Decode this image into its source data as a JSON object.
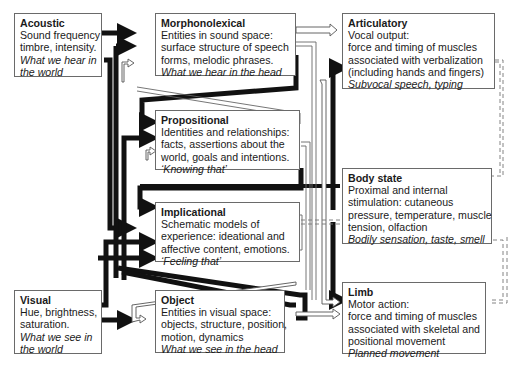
{
  "diagram": {
    "type": "interacting-cognitive-subsystems",
    "boxes": {
      "acoustic": {
        "title": "Acoustic",
        "lines": [
          "Sound frequency",
          "timbre, intensity."
        ],
        "italic": [
          "What we hear in",
          "the world"
        ]
      },
      "morphonolexical": {
        "title": "Morphonolexical",
        "lines": [
          "Entities in sound space:",
          "surface structure of speech",
          "forms, melodic phrases."
        ],
        "italic": [
          "What we hear in the head"
        ]
      },
      "articulatory": {
        "title": "Articulatory",
        "lines": [
          "Vocal output:",
          "force and timing of muscles",
          "associated with verbalization",
          "(including hands and fingers)"
        ],
        "italic": [
          "Subvocal speech, typing"
        ]
      },
      "propositional": {
        "title": "Propositional",
        "lines": [
          "Identities and relationships:",
          "facts, assertions about the",
          "world, goals and intentions."
        ],
        "italic": [
          "‘Knowing that’"
        ]
      },
      "body_state": {
        "title": "Body state",
        "lines": [
          "Proximal and internal",
          "stimulation: cutaneous",
          "pressure, temperature, muscle",
          "tension, olfaction"
        ],
        "italic": [
          "Bodily sensation, taste, smell"
        ]
      },
      "implicational": {
        "title": "Implicational",
        "lines": [
          "Schematic models of",
          "experience: ideational and",
          "affective content, emotions."
        ],
        "italic": [
          "‘Feeling that’"
        ]
      },
      "visual": {
        "title": "Visual",
        "lines": [
          "Hue, brightness,",
          "saturation."
        ],
        "italic": [
          "What we see in",
          "the world"
        ]
      },
      "object": {
        "title": "Object",
        "lines": [
          "Entities in visual space:",
          "objects, structure, position,",
          "motion, dynamics"
        ],
        "italic": [
          "What we see in the head"
        ]
      },
      "limb": {
        "title": "Limb",
        "lines": [
          "Motor action:",
          "force and timing of muscles",
          "associated with skeletal and",
          "positional movement"
        ],
        "italic": [
          "Planned movement"
        ]
      }
    },
    "edges": [
      {
        "from": "Acoustic",
        "to": "Morphonolexical",
        "style": "thick"
      },
      {
        "from": "Acoustic",
        "to": "Implicational",
        "style": "thick"
      },
      {
        "from": "Visual",
        "to": "Object",
        "style": "thick"
      },
      {
        "from": "Visual",
        "to": "Implicational",
        "style": "thick"
      },
      {
        "from": "Morphonolexical",
        "to": "Propositional",
        "style": "thick"
      },
      {
        "from": "Morphonolexical",
        "to": "Articulatory",
        "style": "open"
      },
      {
        "from": "Morphonolexical",
        "to": "Limb",
        "style": "open"
      },
      {
        "from": "Propositional",
        "to": "Morphonolexical",
        "style": "thick"
      },
      {
        "from": "Propositional",
        "to": "Implicational",
        "style": "thick"
      },
      {
        "from": "Propositional",
        "to": "Object",
        "style": "thick"
      },
      {
        "from": "Implicational",
        "to": "Propositional",
        "style": "thick"
      },
      {
        "from": "Implicational",
        "to": "Articulatory",
        "style": "thick"
      },
      {
        "from": "Implicational",
        "to": "Limb",
        "style": "thick"
      },
      {
        "from": "Object",
        "to": "Propositional",
        "style": "thick"
      },
      {
        "from": "Object",
        "to": "Limb",
        "style": "open"
      },
      {
        "from": "Object",
        "to": "Morphonolexical",
        "style": "open"
      },
      {
        "from": "Body state",
        "to": "Implicational",
        "style": "thick"
      },
      {
        "from": "Articulatory",
        "to": "Body state",
        "style": "dashed"
      },
      {
        "from": "Limb",
        "to": "Body state",
        "style": "dashed"
      },
      {
        "from": "Body state",
        "to": "Implicational",
        "style": "dashed"
      }
    ]
  }
}
